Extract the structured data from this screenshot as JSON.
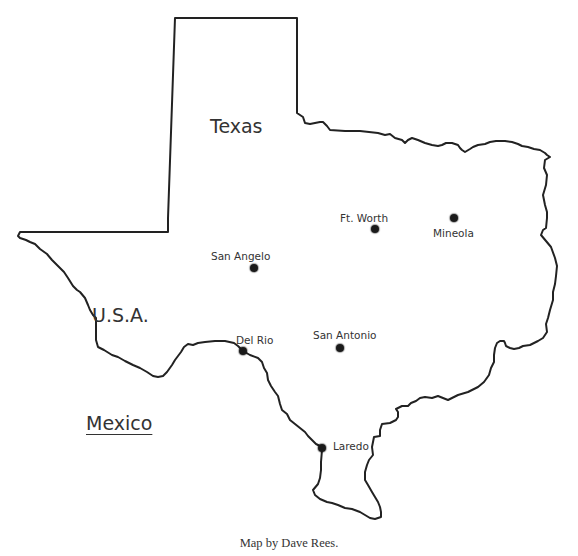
{
  "map": {
    "state_label": "Texas",
    "regions": [
      {
        "label": "U.S.A.",
        "x": 92,
        "y": 306,
        "underline": false
      },
      {
        "label": "Mexico",
        "x": 86,
        "y": 414,
        "underline": true
      }
    ],
    "cities": [
      {
        "name": "Ft. Worth",
        "dot_x": 375,
        "dot_y": 229,
        "label_x": 340,
        "label_y": 213
      },
      {
        "name": "Mineola",
        "dot_x": 454,
        "dot_y": 218,
        "label_x": 433,
        "label_y": 228
      },
      {
        "name": "San Angelo",
        "dot_x": 254,
        "dot_y": 268,
        "label_x": 211,
        "label_y": 251
      },
      {
        "name": "Del Rio",
        "dot_x": 243,
        "dot_y": 351,
        "label_x": 236,
        "label_y": 335
      },
      {
        "name": "San Antonio",
        "dot_x": 340,
        "dot_y": 348,
        "label_x": 313,
        "label_y": 330
      },
      {
        "name": "Laredo",
        "dot_x": 322,
        "dot_y": 448,
        "label_x": 333,
        "label_y": 441
      }
    ],
    "outline_color": "#222222",
    "dot_color": "#1a1a1a"
  },
  "caption": "Map by Dave Rees."
}
